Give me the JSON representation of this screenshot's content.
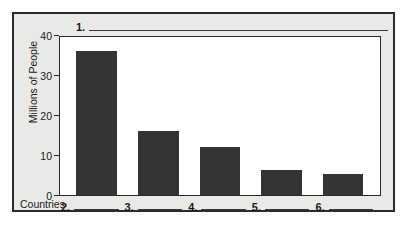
{
  "worksheet": {
    "title_blank_number": "1.",
    "x_axis_caption": "Countries",
    "y_axis_title": "Millions of People",
    "bar_blanks": [
      "2.",
      "3.",
      "4.",
      "5.",
      "6."
    ]
  },
  "colors": {
    "bar_fill": "#343434",
    "card_background": "#e9e9e7",
    "plot_background": "#ffffff",
    "ink": "#1a1a1a",
    "border": "#2b2b2b"
  },
  "chart_data": {
    "type": "bar",
    "title": "",
    "xlabel": "Countries",
    "ylabel": "Millions of People",
    "categories": [
      "2.",
      "3.",
      "4.",
      "5.",
      "6."
    ],
    "values": [
      36.5,
      16.3,
      12.1,
      6.3,
      5.2
    ],
    "ylim": [
      0,
      40
    ],
    "yticks": [
      40,
      30,
      20,
      10,
      0
    ],
    "ytick_labels": [
      "40",
      "30",
      "20",
      "10",
      "0"
    ],
    "grid": false,
    "legend": false
  }
}
